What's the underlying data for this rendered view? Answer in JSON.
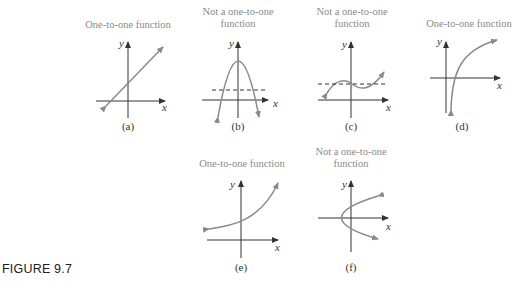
{
  "figure_label": "FIGURE 9.7",
  "colors": {
    "curve": "#8a8a8a",
    "axis": "#333333",
    "title": "#8a8a8a"
  },
  "panels": [
    {
      "id": "a",
      "title_line1": "One-to-one function",
      "title_line2": "",
      "caption": "(a)",
      "x_label": "x",
      "y_label": "y",
      "curve": "increasing line"
    },
    {
      "id": "b",
      "title_line1": "Not a one-to-one",
      "title_line2": "function",
      "caption": "(b)",
      "x_label": "x",
      "y_label": "y",
      "curve": "downward parabola with horizontal dashed line"
    },
    {
      "id": "c",
      "title_line1": "Not a one-to-one",
      "title_line2": "function",
      "caption": "(c)",
      "x_label": "x",
      "y_label": "y",
      "curve": "cubic with horizontal dashed line"
    },
    {
      "id": "d",
      "title_line1": "One-to-one function",
      "title_line2": "",
      "caption": "(d)",
      "x_label": "x",
      "y_label": "y",
      "curve": "logarithmic curve"
    },
    {
      "id": "e",
      "title_line1": "One-to-one function",
      "title_line2": "",
      "caption": "(e)",
      "x_label": "x",
      "y_label": "y",
      "curve": "exponential curve"
    },
    {
      "id": "f",
      "title_line1": "Not a one-to-one",
      "title_line2": "function",
      "caption": "(f)",
      "x_label": "x",
      "y_label": "y",
      "curve": "sideways parabola"
    }
  ]
}
